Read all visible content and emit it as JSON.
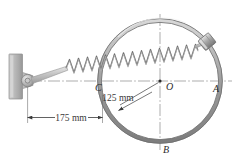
{
  "figure": {
    "kind": "engineering-mechanics-diagram",
    "background_color": "#ffffff",
    "line_color": "#555555",
    "centerline_color": "#777777",
    "metal_light": "#e8e8e8",
    "metal_mid": "#b9b9b9",
    "metal_dark": "#8a8a8a",
    "spring_color": "#6e6e6e"
  },
  "labels": {
    "point_a": "A",
    "point_b": "B",
    "point_c": "C",
    "point_o": "O"
  },
  "dimensions": {
    "radius": {
      "text": "125 mm",
      "value": 125,
      "unit": "mm",
      "measures": "ring radius from O"
    },
    "wall_to_c": {
      "text": "175 mm",
      "value": 175,
      "unit": "mm",
      "measures": "wall pivot to point C"
    }
  },
  "geometry": {
    "ring": {
      "center_x": 160,
      "center_y": 81,
      "radius_outer": 62,
      "radius_inner": 59
    },
    "collar": {
      "x": 207,
      "y": 42,
      "name": "sliding collar on ring"
    },
    "wall_pivot": {
      "x": 27,
      "y": 80
    },
    "wall": {
      "x": 9,
      "y": 54,
      "width": 13,
      "height": 45
    }
  },
  "parts": {
    "wall_label": "fixed wall support",
    "pivot_label": "pin pivot",
    "spring_label": "helical spring",
    "ring_label": "circular ring",
    "collar_label": "collar"
  }
}
